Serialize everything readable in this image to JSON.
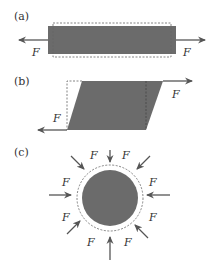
{
  "colors": {
    "fill": "#6b6b6b",
    "stroke": "#555555",
    "dashed": "#666666",
    "arrow": "#555555",
    "text": "#333333"
  },
  "panels": [
    {
      "id": "a",
      "label": "(a)",
      "description": "Tensile stress: bar stretched by opposing forces",
      "force_labels": [
        "F",
        "F"
      ]
    },
    {
      "id": "b",
      "label": "(b)",
      "description": "Shear stress: block sheared into parallelogram",
      "force_labels": [
        "F",
        "F"
      ]
    },
    {
      "id": "c",
      "label": "(c)",
      "description": "Bulk (hydraulic) stress: sphere compressed from all sides",
      "force_labels": [
        "F",
        "F",
        "F",
        "F",
        "F",
        "F",
        "F",
        "F"
      ]
    }
  ],
  "symbols": {
    "force": "F"
  }
}
